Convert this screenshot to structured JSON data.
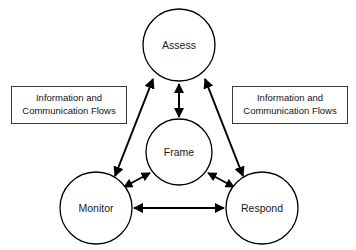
{
  "diagram": {
    "background_color": "#ffffff",
    "stroke_color": "#000000",
    "nodes": [
      {
        "id": "assess",
        "label": "Assess",
        "cx": 179,
        "cy": 45,
        "r": 36
      },
      {
        "id": "frame",
        "label": "Frame",
        "cx": 179,
        "cy": 152,
        "r": 33
      },
      {
        "id": "monitor",
        "label": "Monitor",
        "cx": 96,
        "cy": 208,
        "r": 36
      },
      {
        "id": "respond",
        "label": "Respond",
        "cx": 262,
        "cy": 208,
        "r": 36
      }
    ],
    "connectors": [
      {
        "id": "assess-frame",
        "from": "assess",
        "to": "frame",
        "style": "double-arrow",
        "orientation": "vertical"
      },
      {
        "id": "monitor-respond",
        "from": "monitor",
        "to": "respond",
        "style": "double-arrow",
        "orientation": "horizontal"
      },
      {
        "id": "monitor-assess",
        "from": "monitor",
        "to": "assess",
        "style": "double-arrow",
        "orientation": "diagonal"
      },
      {
        "id": "assess-respond",
        "from": "assess",
        "to": "respond",
        "style": "double-arrow",
        "orientation": "diagonal"
      },
      {
        "id": "monitor-frame",
        "from": "monitor",
        "to": "frame",
        "style": "double-arrow",
        "orientation": "diagonal"
      },
      {
        "id": "frame-respond",
        "from": "frame",
        "to": "respond",
        "style": "double-arrow",
        "orientation": "diagonal"
      }
    ],
    "notes": {
      "left": {
        "line1": "Information and",
        "line2": "Communication Flows"
      },
      "right": {
        "line1": "Information and",
        "line2": "Communication Flows"
      }
    }
  }
}
